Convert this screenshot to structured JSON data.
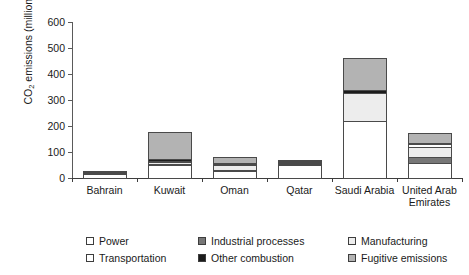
{
  "chart_data": {
    "type": "bar",
    "stacked": true,
    "title": "",
    "xlabel": "",
    "ylabel": "CO2 emissions (million tonnes/year)",
    "ylabel_parts": {
      "prefix": "CO",
      "sub": "2",
      "suffix": " emissions (million tonnes/year)"
    },
    "ylim": [
      0,
      600
    ],
    "yticks": [
      0,
      100,
      200,
      300,
      400,
      500,
      600
    ],
    "grid": false,
    "legend_position": "bottom",
    "categories": [
      "Bahrain",
      "Kuwait",
      "Oman",
      "Qatar",
      "Saudi Arabia",
      "United Arab Emirates"
    ],
    "series": [
      {
        "name": "Power",
        "color": "#ffffff",
        "values": [
          20,
          55,
          30,
          52,
          225,
          62
        ]
      },
      {
        "name": "Industrial processes",
        "color": "#777777",
        "values": [
          0,
          8,
          10,
          4,
          0,
          28
        ]
      },
      {
        "name": "Manufacturing",
        "color": "#ededed",
        "values": [
          0,
          12,
          20,
          6,
          110,
          42
        ]
      },
      {
        "name": "Transportation",
        "color": "#ffffff",
        "values": [
          2,
          6,
          8,
          4,
          0,
          14
        ]
      },
      {
        "name": "Other combustion",
        "color": "#1c1c1c",
        "values": [
          6,
          9,
          7,
          9,
          17,
          10
        ]
      },
      {
        "name": "Fugitive emissions",
        "color": "#b3b3b3",
        "values": [
          2,
          110,
          30,
          5,
          125,
          42
        ]
      }
    ],
    "totals": [
      30,
      200,
      105,
      80,
      477,
      198
    ]
  },
  "legend": {
    "items": [
      {
        "label": "Power",
        "color": "#ffffff"
      },
      {
        "label": "Industrial processes",
        "color": "#777777"
      },
      {
        "label": "Manufacturing",
        "color": "#ededed"
      },
      {
        "label": "Transportation",
        "color": "#ffffff"
      },
      {
        "label": "Other combustion",
        "color": "#1c1c1c"
      },
      {
        "label": "Fugitive emissions",
        "color": "#b3b3b3"
      }
    ]
  }
}
